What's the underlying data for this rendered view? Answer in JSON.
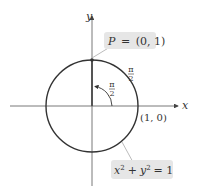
{
  "diagram": {
    "axes": {
      "x_label": "x",
      "y_label": "y"
    },
    "point_P": {
      "name": "P",
      "eq": "=",
      "coords": "(0, 1)"
    },
    "arc_angle": {
      "num": "π",
      "den": "2"
    },
    "central_angle": {
      "num": "π",
      "den": "2"
    },
    "point_10": "(1, 0)",
    "equation": {
      "x": "x",
      "exp1": "2",
      "plus": "+",
      "y": "y",
      "exp2": "2",
      "eq": "= 1"
    },
    "colors": {
      "circle": "#333333",
      "axis": "#444444",
      "label_bg": "#e6e6e6"
    }
  }
}
